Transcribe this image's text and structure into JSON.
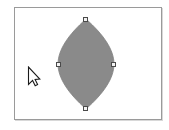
{
  "app": {
    "title": "Shape Selection Canvas",
    "background_color": "#ffffff"
  },
  "canvas": {
    "name": "drawing-canvas",
    "background_color": "#ffffff",
    "border_color": "#9a9a9a",
    "shadow_color": "#d8d8d8",
    "x": 14,
    "y": 7,
    "width": 148,
    "height": 113
  },
  "shape": {
    "name": "lens-shape",
    "type": "vesica",
    "label": "Pointed oval shape",
    "fill_color": "#8a8a8a",
    "stroke_color": "#7d7d7d",
    "selected": true,
    "center_x": 71,
    "center_y": 56,
    "half_width": 28,
    "half_height": 45,
    "path": "M 71 11 C 89 27 99 42 99 56 C 99 70 89 85 71 101 C 53 85 43 70 43 56 C 43 42 53 27 71 11 Z"
  },
  "handles": {
    "name": "selection-handles",
    "count": 4,
    "fill_color": "#f2f2f2",
    "stroke_color": "#4a4a4a",
    "size": 5,
    "items": [
      {
        "id": "handle-top",
        "position": "top",
        "label": "Top resize handle"
      },
      {
        "id": "handle-bottom",
        "position": "bottom",
        "label": "Bottom resize handle"
      },
      {
        "id": "handle-left",
        "position": "left",
        "label": "Left resize handle"
      },
      {
        "id": "handle-right",
        "position": "right",
        "label": "Right resize handle"
      }
    ]
  },
  "cursor": {
    "name": "arrow-cursor",
    "label": "Mouse pointer",
    "fill_color": "#ffffff",
    "stroke_color": "#1a1a1a",
    "x": 27,
    "y": 66
  }
}
